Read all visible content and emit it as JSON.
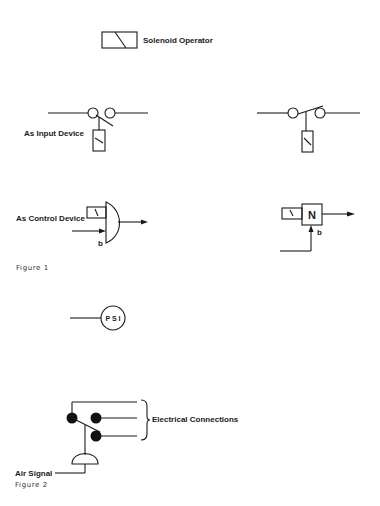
{
  "legend": {
    "solenoid_operator_label": "Solenoid Operator"
  },
  "figure1": {
    "caption": "Figure 1",
    "input_device_label": "As Input Device",
    "control_device_label": "As Control Device",
    "control_input_marker": "b",
    "n_block_label": "N",
    "n_block_input_marker": "b"
  },
  "psi_symbol": {
    "label": "P S I"
  },
  "figure2": {
    "caption": "Figure 2",
    "electrical_connections_label": "Electrical Connections",
    "air_signal_label": "Air Signal"
  },
  "colors": {
    "stroke": "#1a1a1a",
    "background": "#ffffff"
  }
}
